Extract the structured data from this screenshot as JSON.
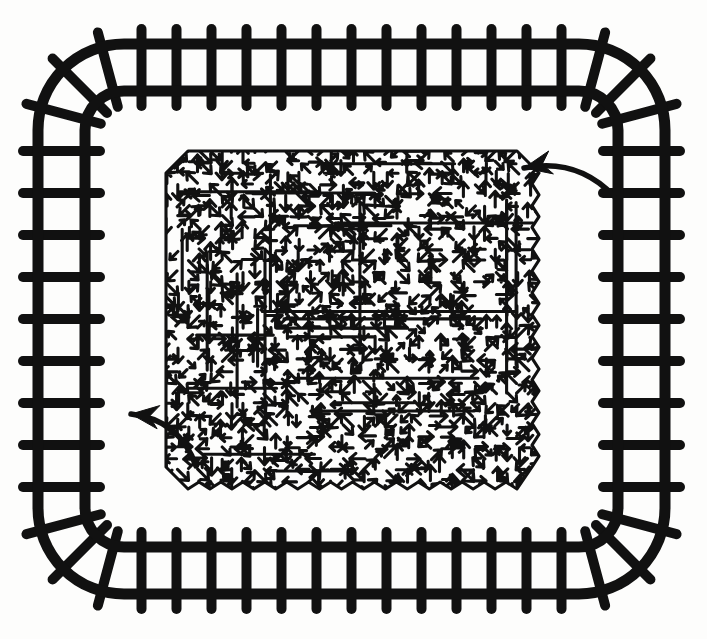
{
  "canvas": {
    "width": 707,
    "height": 639,
    "background_color": "#fdfdfc",
    "ink_color": "#111111",
    "style": "black-and-white line drawing"
  },
  "frame": {
    "name": "ladder-track-border",
    "shape": "rounded-rectangle",
    "stroke_color": "#111111",
    "rail_thickness": 11,
    "rung_thickness": 10,
    "corner_radius": 86,
    "outer_rail": {
      "left": 38,
      "top": 44,
      "right": 665,
      "bottom": 594
    },
    "rail_gap": 47,
    "rung_overhang": 15,
    "rung_counts": {
      "top": 13,
      "bottom": 13,
      "left": 9,
      "right": 9,
      "corner_spokes": 3
    },
    "rung_spacing": {
      "horizontal": 40,
      "vertical": 48
    }
  },
  "field": {
    "name": "arrow-texture-field",
    "label": "dense field of directional arrow marks",
    "bounds": {
      "left": 166,
      "top": 151,
      "right": 539,
      "bottom": 489
    },
    "border": {
      "top": "straight",
      "left": "straight",
      "right": "zigzag",
      "bottom": "zigzag",
      "corners": "chamfered"
    },
    "mark_color": "#111111",
    "mark_density": "very high",
    "mark_type": "chevron-arrowhead segments",
    "grid_step": 11,
    "stroke_width": 3.1,
    "seed": 20240517
  },
  "annotations": {
    "arrows": [
      {
        "name": "callout-arrow-top-right",
        "tail_x": 614,
        "tail_y": 196,
        "tip_x": 524,
        "tip_y": 168,
        "direction": "points left into the field",
        "curve": "concave-down"
      },
      {
        "name": "callout-arrow-bottom-left",
        "tail_x": 196,
        "tail_y": 466,
        "tip_x": 131,
        "tip_y": 414,
        "direction": "points up-left away from the field",
        "curve": "concave-right"
      }
    ]
  },
  "legend": {
    "visible": false,
    "entries": []
  }
}
